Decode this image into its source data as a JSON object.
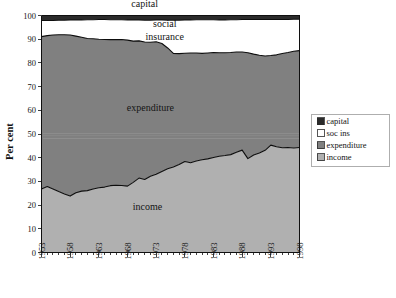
{
  "chart_data": {
    "type": "area",
    "stacked": true,
    "title": "",
    "xlabel": "",
    "ylabel": "Per cent",
    "ylim": [
      0,
      100
    ],
    "xlim": [
      1953,
      1998
    ],
    "grid": false,
    "legend_position": "right",
    "ytick_labels": [
      "0",
      "10",
      "20",
      "30",
      "40",
      "50",
      "60",
      "70",
      "80",
      "90",
      "100"
    ],
    "ytick_values": [
      0,
      10,
      20,
      30,
      40,
      50,
      60,
      70,
      80,
      90,
      100
    ],
    "xtick_labels": [
      "1953",
      "1958",
      "1963",
      "1968",
      "1973",
      "1978",
      "1983",
      "1988",
      "1993",
      "1998"
    ],
    "xtick_values": [
      1953,
      1958,
      1963,
      1968,
      1973,
      1978,
      1983,
      1988,
      1993,
      1998
    ],
    "x": [
      1953,
      1954,
      1955,
      1956,
      1957,
      1958,
      1959,
      1960,
      1961,
      1962,
      1963,
      1964,
      1965,
      1966,
      1967,
      1968,
      1969,
      1970,
      1971,
      1972,
      1973,
      1974,
      1975,
      1976,
      1977,
      1978,
      1979,
      1980,
      1981,
      1982,
      1983,
      1984,
      1985,
      1986,
      1987,
      1988,
      1989,
      1990,
      1991,
      1992,
      1993,
      1994,
      1995,
      1996,
      1997,
      1998
    ],
    "series": [
      {
        "name": "income",
        "legend_label": "income",
        "inplot_label": "income",
        "color": "#b0b0b0",
        "values": [
          26.8,
          27.8,
          26.8,
          25.7,
          24.7,
          23.8,
          25.2,
          25.9,
          26.1,
          26.8,
          27.3,
          27.6,
          28.2,
          28.4,
          28.3,
          28.0,
          29.6,
          31.4,
          30.8,
          32.2,
          33.0,
          34.2,
          35.3,
          36.1,
          37.1,
          38.4,
          37.9,
          38.6,
          39.1,
          39.5,
          40.1,
          40.6,
          40.9,
          41.3,
          42.3,
          43.2,
          39.6,
          41.1,
          42.0,
          43.1,
          45.3,
          44.6,
          44.2,
          44.3,
          44.1,
          44.3
        ]
      },
      {
        "name": "expenditure",
        "legend_label": "expenditure",
        "inplot_label": "expenditure",
        "color": "#808080",
        "top_values": [
          91.1,
          91.5,
          91.8,
          91.9,
          91.9,
          91.8,
          91.3,
          90.8,
          90.3,
          90.2,
          90.0,
          89.9,
          89.8,
          89.8,
          89.9,
          89.6,
          89.2,
          89.3,
          88.8,
          88.7,
          88.9,
          88.2,
          86.3,
          84.0,
          83.9,
          84.1,
          84.2,
          84.2,
          84.0,
          84.2,
          84.4,
          84.3,
          84.3,
          84.4,
          84.6,
          84.6,
          84.3,
          83.7,
          83.2,
          82.9,
          83.1,
          83.4,
          84.0,
          84.4,
          84.9,
          85.2
        ]
      },
      {
        "name": "soc ins",
        "legend_label": "soc ins",
        "inplot_label": "social insurance",
        "color": "#ffffff",
        "top_values": [
          97.9,
          97.9,
          97.9,
          98.0,
          98.0,
          98.1,
          98.1,
          98.1,
          98.2,
          98.2,
          98.3,
          98.3,
          98.2,
          98.2,
          98.2,
          98.1,
          98.1,
          98.1,
          98.0,
          98.0,
          98.1,
          98.1,
          98.0,
          98.0,
          98.0,
          98.1,
          98.1,
          98.2,
          98.2,
          98.2,
          98.2,
          98.1,
          98.1,
          98.2,
          98.2,
          98.3,
          98.3,
          98.3,
          98.3,
          98.3,
          98.3,
          98.3,
          98.3,
          98.3,
          98.4,
          98.4
        ]
      },
      {
        "name": "capital",
        "legend_label": "capital",
        "inplot_label": "capital",
        "color": "#2b2b2b",
        "top_values": [
          100,
          100,
          100,
          100,
          100,
          100,
          100,
          100,
          100,
          100,
          100,
          100,
          100,
          100,
          100,
          100,
          100,
          100,
          100,
          100,
          100,
          100,
          100,
          100,
          100,
          100,
          100,
          100,
          100,
          100,
          100,
          100,
          100,
          100,
          100,
          100,
          100,
          100,
          100,
          100,
          100,
          100,
          100,
          100,
          100,
          100
        ]
      }
    ],
    "annotations": [
      {
        "text": "capital",
        "x": 1971,
        "y": 103.5
      },
      {
        "text": "social",
        "x": 1974.5,
        "y": 95.0
      },
      {
        "text": "insurance",
        "x": 1974.5,
        "y": 89.5
      },
      {
        "text": "expenditure",
        "x": 1972,
        "y": 59.5
      },
      {
        "text": "income",
        "x": 1971.5,
        "y": 18.0
      }
    ],
    "legend_entries": [
      {
        "label": "capital",
        "color": "#2b2b2b"
      },
      {
        "label": "soc ins",
        "color": "#ffffff"
      },
      {
        "label": "expenditure",
        "color": "#808080"
      },
      {
        "label": "income",
        "color": "#b0b0b0"
      }
    ]
  }
}
